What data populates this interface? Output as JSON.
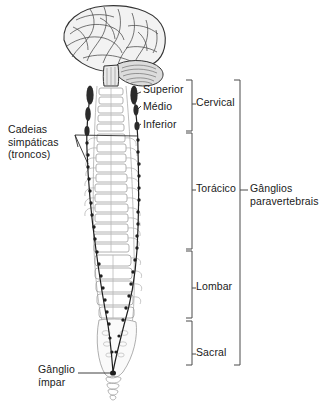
{
  "figure": {
    "background_color": "#ffffff",
    "ink_color": "#1a1a1a",
    "ganglion_color": "#2b2b2b",
    "bone_color": "#8c8c8c"
  },
  "labels": {
    "chains": "Cadeias\nsimpáticas\n(troncos)",
    "superior": "Superior",
    "medio": "Médio",
    "inferior": "Inferior",
    "cervical": "Cervical",
    "toracico": "Torácico",
    "lombar": "Lombar",
    "sacral": "Sacral",
    "paravertebrais": "Gânglios\nparavertebrais",
    "impar": "Gânglio\nímpar"
  },
  "regions": [
    {
      "name": "Cervical",
      "top": 80,
      "bottom": 131
    },
    {
      "name": "Torácico",
      "top": 133,
      "bottom": 249
    },
    {
      "name": "Lombar",
      "top": 251,
      "bottom": 318
    },
    {
      "name": "Sacral",
      "top": 321,
      "bottom": 365
    }
  ],
  "cervical_ganglia": [
    {
      "name": "Superior",
      "y": 92
    },
    {
      "name": "Médio",
      "y": 108
    },
    {
      "name": "Inferior",
      "y": 125
    }
  ],
  "anatomy_parts": [
    "cerebro",
    "cerebelo",
    "tronco-encefalico",
    "coluna-vertebral",
    "costelas",
    "sacro",
    "coccix",
    "tronco-simpatico-esquerdo",
    "tronco-simpatico-direito",
    "ganglio-impar"
  ]
}
